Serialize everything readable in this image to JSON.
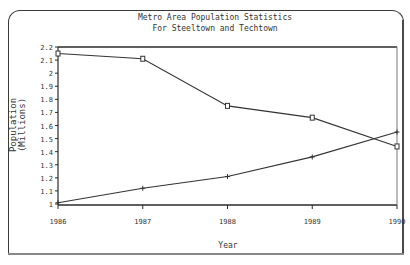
{
  "chart_data": {
    "type": "line",
    "title": "Metro Area Population Statistics",
    "subtitle": "For Steeltown and Techtown",
    "xlabel": "Year",
    "ylabel": "Population (Millions)",
    "ylabel_line1": "Population",
    "ylabel_line2": "(Millions)",
    "categories": [
      "1986",
      "1987",
      "1988",
      "1989",
      "1990"
    ],
    "yticks": [
      "1",
      "1.1",
      "1.2",
      "1.3",
      "1.4",
      "1.5",
      "1.6",
      "1.7",
      "1.8",
      "1.9",
      "2",
      "2.1",
      "2.2"
    ],
    "ylim": [
      1,
      2.2
    ],
    "grid": false,
    "legend": "none",
    "series": [
      {
        "name": "Steeltown",
        "marker": "square",
        "values": [
          2.15,
          2.11,
          1.75,
          1.66,
          1.44
        ]
      },
      {
        "name": "Techtown",
        "marker": "plus",
        "values": [
          1.01,
          1.12,
          1.21,
          1.36,
          1.55
        ]
      }
    ]
  },
  "colors": {
    "line": "#333333",
    "axis": "#2a2a2a",
    "background": "#ffffff"
  }
}
